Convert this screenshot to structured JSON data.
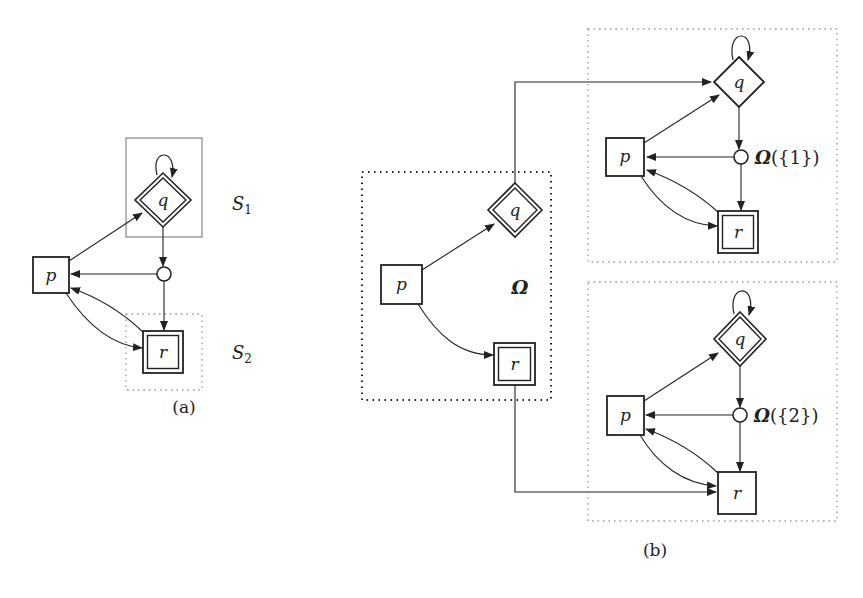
{
  "figure": {
    "panel_a": {
      "caption": "(a)",
      "nodes": {
        "q": "q",
        "p": "p",
        "r": "r"
      },
      "sets": {
        "s1": {
          "base": "S",
          "sub": "1"
        },
        "s2": {
          "base": "S",
          "sub": "2"
        }
      }
    },
    "panel_b": {
      "caption": "(b)",
      "left": {
        "nodes": {
          "q": "q",
          "p": "p",
          "r": "r"
        },
        "region_label": "Ω"
      },
      "top_right": {
        "nodes": {
          "q": "q",
          "p": "p",
          "r": "r"
        },
        "omega": "Ω",
        "omega_arg": "({1})"
      },
      "bottom_right": {
        "nodes": {
          "q": "q",
          "p": "p",
          "r": "r"
        },
        "omega": "Ω",
        "omega_arg": "({2})"
      }
    },
    "colors": {
      "stroke": "#222222",
      "gray_box": "#888888",
      "dots": "#999999"
    }
  }
}
